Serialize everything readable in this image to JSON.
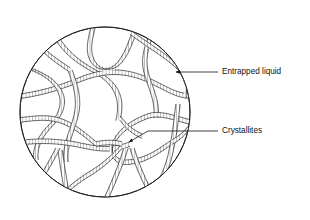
{
  "figure": {
    "background_color": "#ffffff",
    "line_color": "#1a1a1a",
    "fill_color": "#ffffff"
  },
  "boundary": {
    "shape": "circle",
    "center_x": 105,
    "center_y": 112,
    "radius": 85,
    "stroke_width": 0.9
  },
  "network": {
    "band_style": "ladder-hatched double line",
    "band_width": 4.2,
    "rung_spacing": 3.2,
    "stroke_width": 0.65,
    "description": "Interconnected ribbon-like crystallite strands forming closed cells"
  },
  "annotations": [
    {
      "id": "entrapped-liquid",
      "label": "Entrapped liquid",
      "text_x": 222,
      "text_y": 72,
      "leader_x1": 218,
      "leader_y1": 72,
      "leader_x2": 176,
      "leader_y2": 72,
      "arrow_x": 170,
      "arrow_y": 72,
      "arrow_angle": 180
    },
    {
      "id": "crystallites",
      "label": "Crystallites",
      "text_x": 222,
      "text_y": 131,
      "leader_x1": 218,
      "leader_y1": 131,
      "leader_x2": 148,
      "leader_y2": 131,
      "arrow_x": 127,
      "arrow_y": 143,
      "arrow_angle": 210
    }
  ]
}
